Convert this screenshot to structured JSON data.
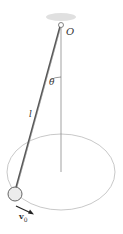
{
  "diagram": {
    "labels": {
      "pivot": "O",
      "angle": "θ",
      "length": "l",
      "velocity": "v",
      "velocity_subscript": "0"
    },
    "colors": {
      "rod": "#555555",
      "orbit": "#aaaaaa",
      "axis": "#777777",
      "bob_fill": "#eeeeee",
      "bob_stroke": "#666666",
      "arrow": "#222222",
      "mount": "#d8d8d8"
    }
  }
}
